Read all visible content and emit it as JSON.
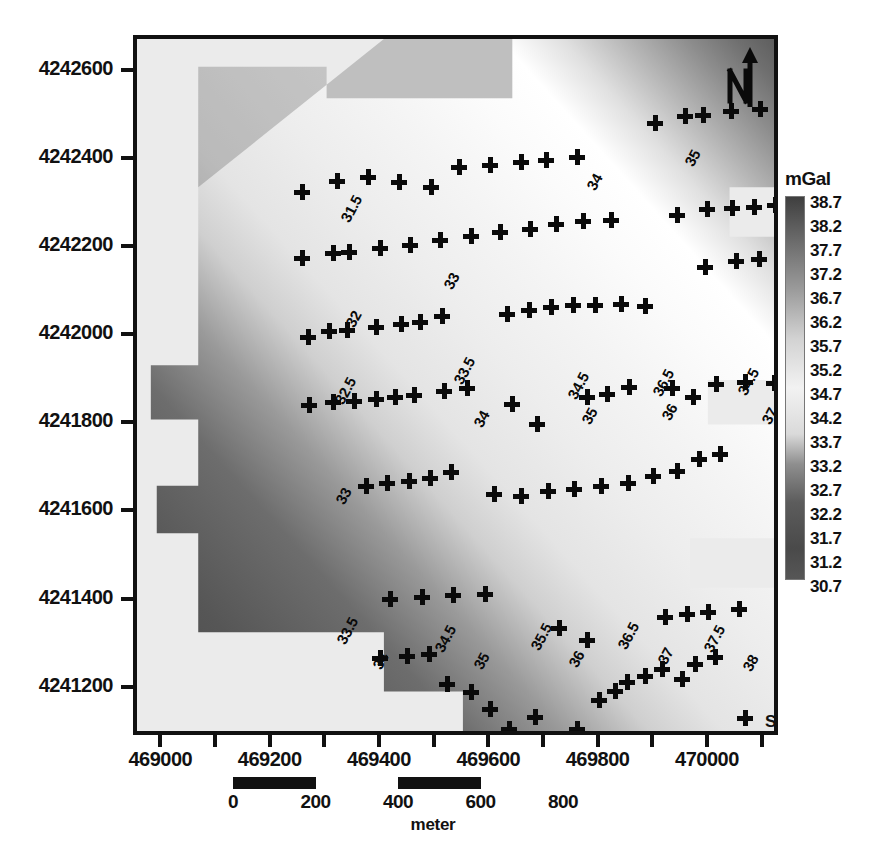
{
  "figure": {
    "kind": "contour-map",
    "unit_label": "mGal"
  },
  "axes": {
    "x": {
      "labels": [
        "469000",
        "469200",
        "469400",
        "469600",
        "469800",
        "470000"
      ],
      "label_values": [
        469000,
        469200,
        469400,
        469600,
        469800,
        470000
      ],
      "tick_values": [
        469000,
        469100,
        469200,
        469300,
        469400,
        469500,
        469600,
        469700,
        469800,
        469900,
        470000,
        470100
      ],
      "min": 468950,
      "max": 470130
    },
    "y": {
      "labels": [
        "4242600",
        "4242400",
        "4242200",
        "4242000",
        "4241800",
        "4241600",
        "4241400",
        "4241200"
      ],
      "label_values": [
        4242600,
        4242400,
        4242200,
        4242000,
        4241800,
        4241600,
        4241400,
        4241200
      ],
      "min": 4241090,
      "max": 4242680
    }
  },
  "colorbar": {
    "title": "mGal",
    "ticks": [
      "38.7",
      "38.2",
      "37.7",
      "37.2",
      "36.7",
      "36.2",
      "35.7",
      "35.2",
      "34.7",
      "34.2",
      "33.7",
      "33.2",
      "32.7",
      "32.2",
      "31.7",
      "31.2",
      "30.7"
    ],
    "min": 30.7,
    "max": 38.7,
    "step": 0.5,
    "dark_color": "#3f3f3f",
    "light_color": "#f2f2f2"
  },
  "scalebar": {
    "segments": [
      {
        "from": "0",
        "to": "200"
      },
      {
        "from": "400",
        "to": "600"
      }
    ],
    "labels": [
      "0",
      "200",
      "400",
      "600",
      "800"
    ],
    "label_values": [
      0,
      200,
      400,
      600,
      800
    ],
    "unit": "meter"
  },
  "legend": {
    "marker": "plus-cross",
    "text": "Station Location"
  },
  "north_arrow": {
    "letter": "N"
  },
  "chart_data": {
    "type": "heatmap",
    "title": "",
    "xlabel": "",
    "ylabel": "",
    "unit": "mGal",
    "xlim": [
      468950,
      470130
    ],
    "ylim": [
      4241090,
      4242680
    ],
    "zlim": [
      30.7,
      38.7
    ],
    "grid": false,
    "legend_position": "bottom-right",
    "contour_labels": [
      {
        "value": "31.5",
        "x": 200,
        "y": 178,
        "rot": -62
      },
      {
        "value": "32",
        "x": 205,
        "y": 283,
        "rot": -62
      },
      {
        "value": "33",
        "x": 303,
        "y": 245,
        "rot": -62
      },
      {
        "value": "34",
        "x": 446,
        "y": 146,
        "rot": -62
      },
      {
        "value": "35",
        "x": 544,
        "y": 122,
        "rot": -62
      },
      {
        "value": "36",
        "x": 668,
        "y": 124,
        "rot": -62
      },
      {
        "value": "33.5",
        "x": 313,
        "y": 340,
        "rot": -62
      },
      {
        "value": "34.5",
        "x": 427,
        "y": 355,
        "rot": -62
      },
      {
        "value": "35",
        "x": 441,
        "y": 380,
        "rot": -62
      },
      {
        "value": "36.5",
        "x": 512,
        "y": 352,
        "rot": -62
      },
      {
        "value": "36",
        "x": 521,
        "y": 376,
        "rot": -62
      },
      {
        "value": "34.5",
        "x": 597,
        "y": 351,
        "rot": -62
      },
      {
        "value": "37.5",
        "x": 697,
        "y": 348,
        "rot": -62
      },
      {
        "value": "32.5",
        "x": 194,
        "y": 360,
        "rot": -62
      },
      {
        "value": "34",
        "x": 333,
        "y": 383,
        "rot": -62
      },
      {
        "value": "37",
        "x": 621,
        "y": 380,
        "rot": -62
      },
      {
        "value": "33",
        "x": 195,
        "y": 460,
        "rot": -62
      },
      {
        "value": "38",
        "x": 687,
        "y": 455,
        "rot": -62
      },
      {
        "value": "33.5",
        "x": 196,
        "y": 600,
        "rot": -62
      },
      {
        "value": "34",
        "x": 232,
        "y": 625,
        "rot": -62
      },
      {
        "value": "34.5",
        "x": 294,
        "y": 608,
        "rot": -62
      },
      {
        "value": "35",
        "x": 333,
        "y": 625,
        "rot": -62
      },
      {
        "value": "35.5",
        "x": 390,
        "y": 606,
        "rot": -62
      },
      {
        "value": "36",
        "x": 428,
        "y": 623,
        "rot": -62
      },
      {
        "value": "36.5",
        "x": 477,
        "y": 605,
        "rot": -62
      },
      {
        "value": "37",
        "x": 517,
        "y": 620,
        "rot": -62
      },
      {
        "value": "37.5",
        "x": 563,
        "y": 608,
        "rot": -62
      },
      {
        "value": "38",
        "x": 602,
        "y": 627,
        "rot": -62
      },
      {
        "value": "38.5",
        "x": 664,
        "y": 582,
        "rot": -62
      }
    ],
    "stations": [
      [
        165,
        153
      ],
      [
        200,
        142
      ],
      [
        231,
        138
      ],
      [
        262,
        143
      ],
      [
        294,
        148
      ],
      [
        322,
        128
      ],
      [
        353,
        126
      ],
      [
        384,
        123
      ],
      [
        409,
        121
      ],
      [
        440,
        118
      ],
      [
        518,
        84
      ],
      [
        548,
        77
      ],
      [
        566,
        76
      ],
      [
        594,
        72
      ],
      [
        623,
        70
      ],
      [
        684,
        61
      ],
      [
        165,
        219
      ],
      [
        196,
        214
      ],
      [
        212,
        213
      ],
      [
        243,
        209
      ],
      [
        273,
        206
      ],
      [
        303,
        201
      ],
      [
        334,
        197
      ],
      [
        363,
        193
      ],
      [
        393,
        190
      ],
      [
        419,
        185
      ],
      [
        446,
        182
      ],
      [
        474,
        181
      ],
      [
        540,
        176
      ],
      [
        570,
        170
      ],
      [
        595,
        169
      ],
      [
        617,
        168
      ],
      [
        638,
        166
      ],
      [
        663,
        157
      ],
      [
        688,
        156
      ],
      [
        171,
        298
      ],
      [
        192,
        292
      ],
      [
        210,
        291
      ],
      [
        239,
        288
      ],
      [
        264,
        285
      ],
      [
        283,
        283
      ],
      [
        305,
        277
      ],
      [
        370,
        275
      ],
      [
        392,
        271
      ],
      [
        414,
        268
      ],
      [
        436,
        266
      ],
      [
        458,
        266
      ],
      [
        484,
        265
      ],
      [
        508,
        267
      ],
      [
        568,
        228
      ],
      [
        599,
        222
      ],
      [
        622,
        220
      ],
      [
        652,
        214
      ],
      [
        675,
        214
      ],
      [
        700,
        211
      ],
      [
        172,
        366
      ],
      [
        196,
        363
      ],
      [
        217,
        362
      ],
      [
        239,
        360
      ],
      [
        258,
        358
      ],
      [
        277,
        356
      ],
      [
        307,
        352
      ],
      [
        330,
        349
      ],
      [
        375,
        365
      ],
      [
        400,
        385
      ],
      [
        450,
        358
      ],
      [
        470,
        355
      ],
      [
        492,
        348
      ],
      [
        535,
        349
      ],
      [
        556,
        358
      ],
      [
        579,
        345
      ],
      [
        608,
        343
      ],
      [
        637,
        344
      ],
      [
        657,
        339
      ],
      [
        678,
        332
      ],
      [
        700,
        330
      ],
      [
        712,
        328
      ],
      [
        229,
        447
      ],
      [
        250,
        444
      ],
      [
        272,
        442
      ],
      [
        293,
        439
      ],
      [
        314,
        433
      ],
      [
        357,
        455
      ],
      [
        384,
        457
      ],
      [
        411,
        452
      ],
      [
        437,
        450
      ],
      [
        464,
        447
      ],
      [
        491,
        444
      ],
      [
        516,
        437
      ],
      [
        540,
        432
      ],
      [
        562,
        420
      ],
      [
        583,
        415
      ],
      [
        253,
        560
      ],
      [
        285,
        558
      ],
      [
        316,
        556
      ],
      [
        348,
        555
      ],
      [
        422,
        589
      ],
      [
        450,
        601
      ],
      [
        528,
        578
      ],
      [
        550,
        575
      ],
      [
        571,
        573
      ],
      [
        602,
        570
      ],
      [
        243,
        619
      ],
      [
        270,
        617
      ],
      [
        292,
        615
      ],
      [
        310,
        645
      ],
      [
        334,
        653
      ],
      [
        353,
        670
      ],
      [
        372,
        690
      ],
      [
        398,
        678
      ],
      [
        413,
        700
      ],
      [
        440,
        690
      ],
      [
        462,
        661
      ],
      [
        478,
        652
      ],
      [
        490,
        643
      ],
      [
        508,
        637
      ],
      [
        525,
        630
      ],
      [
        545,
        640
      ],
      [
        558,
        625
      ],
      [
        578,
        618
      ]
    ]
  }
}
